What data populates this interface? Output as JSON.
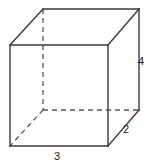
{
  "figure": {
    "shape_type": "rectangular-prism",
    "projection": "oblique",
    "colors": {
      "background": "#ffffff",
      "visible_edge": "#3a3a3a",
      "hidden_edge": "#555555",
      "label_text": "#1a1a1a"
    },
    "dimensions": {
      "width_label": "3",
      "depth_label": "2",
      "height_label": "4"
    },
    "labels": [
      {
        "id": "width",
        "text": "3",
        "x": 57,
        "y": 157,
        "edge": "front-bottom"
      },
      {
        "id": "depth",
        "text": "2",
        "x": 126,
        "y": 130,
        "edge": "bottom-right-diagonal"
      },
      {
        "id": "height",
        "text": "4",
        "x": 141,
        "y": 62,
        "edge": "right-vertical"
      }
    ],
    "geometry": {
      "front_face": {
        "top_left": [
          10,
          45
        ],
        "top_right": [
          108,
          45
        ],
        "bottom_right": [
          108,
          146
        ],
        "bottom_left": [
          10,
          146
        ]
      },
      "back_face": {
        "top_left": [
          43,
          9
        ],
        "top_right": [
          139,
          9
        ],
        "bottom_right": [
          139,
          110
        ],
        "bottom_left": [
          43,
          110
        ]
      },
      "visible_edges": [
        "front-top",
        "front-right",
        "front-bottom",
        "front-left",
        "back-top",
        "back-right",
        "top-left-diagonal",
        "top-right-diagonal",
        "bottom-right-diagonal"
      ],
      "hidden_edges": [
        "back-left-vertical",
        "back-bottom-horizontal",
        "bottom-left-diagonal"
      ]
    }
  }
}
